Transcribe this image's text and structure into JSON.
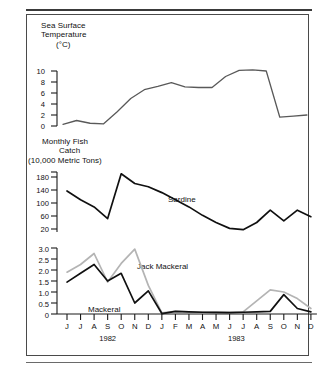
{
  "figure": {
    "name": "sea-surface-temperature-and-monthly-fish-catch",
    "background": "#ffffff",
    "frame_color": "#4a4a4a"
  },
  "colors": {
    "temperature_line": "#595959",
    "sardine_line": "#101010",
    "mackerel_line": "#101010",
    "jack_mackerel_line": "#b4b4b4",
    "axis": "#1a1a1a",
    "text": "#111111"
  },
  "x_axis": {
    "name": "month-axis",
    "months": [
      "J",
      "J",
      "A",
      "S",
      "O",
      "N",
      "D",
      "J",
      "F",
      "M",
      "A",
      "M",
      "J",
      "J",
      "A",
      "S",
      "O",
      "N",
      "D"
    ],
    "year_groups": [
      {
        "label": "1982",
        "start_index": 0,
        "end_index": 6
      },
      {
        "label": "1983",
        "start_index": 7,
        "end_index": 18
      }
    ],
    "tick_count": 19
  },
  "panels": {
    "temperature": {
      "title_line1": "Sea Surface",
      "title_line2": "Temperature",
      "title_line3": "(°C)",
      "y_ticks": [
        "0",
        "2",
        "4",
        "6",
        "8",
        "10"
      ]
    },
    "catch": {
      "title_line1": "Monthly Fish",
      "title_line2": "Catch",
      "title_line3": "(10,000 Metric Tons)",
      "y_ticks": [
        "20",
        "60",
        "100",
        "140",
        "180"
      ],
      "series_label": "Sardine"
    },
    "small_pelagics": {
      "y_ticks": [
        "0",
        "0.5",
        "1.0",
        "1.5",
        "2.0",
        "2.5",
        "3.0"
      ],
      "series_label_jack": "Jack Mackeral",
      "series_label_mackerel": "Mackeral"
    }
  },
  "chart_data": [
    {
      "type": "line",
      "name": "sea-surface-temperature",
      "title": "Sea Surface Temperature (°C)",
      "xlabel": "",
      "ylabel": "Sea Surface Temperature (°C)",
      "x": [
        "J 1982",
        "J 1982",
        "A 1982",
        "S 1982",
        "O 1982",
        "N 1982",
        "D 1982",
        "J 1983",
        "F 1983",
        "M 1983",
        "A 1983",
        "M 1983",
        "J 1983",
        "J 1983",
        "A 1983",
        "S 1983",
        "O 1983",
        "N 1983",
        "D 1983"
      ],
      "ylim": [
        0,
        11
      ],
      "y_ticks": [
        0,
        2,
        4,
        6,
        8,
        10
      ],
      "grid": false,
      "legend": "none",
      "series": [
        {
          "name": "Sea Surface Temperature",
          "color": "#595959",
          "values": [
            0.3,
            1.0,
            0.5,
            0.4,
            2.6,
            5.0,
            6.6,
            7.2,
            7.9,
            7.1,
            7.0,
            7.0,
            9.0,
            10.1,
            10.2,
            10.0,
            1.6,
            1.8,
            2.0,
            0.1
          ]
        }
      ]
    },
    {
      "type": "line",
      "name": "monthly-fish-catch-sardine",
      "title": "Monthly Fish Catch (10,000 Metric Tons)",
      "xlabel": "",
      "ylabel": "Monthly Fish Catch (10,000 Metric Tons)",
      "x": [
        "J 1982",
        "J 1982",
        "A 1982",
        "S 1982",
        "O 1982",
        "N 1982",
        "D 1982",
        "J 1983",
        "F 1983",
        "M 1983",
        "A 1983",
        "M 1983",
        "J 1983",
        "J 1983",
        "A 1983",
        "S 1983",
        "O 1983",
        "N 1983",
        "D 1983"
      ],
      "ylim": [
        0,
        200
      ],
      "y_ticks": [
        20,
        60,
        100,
        140,
        180
      ],
      "grid": false,
      "legend": "inline",
      "series": [
        {
          "name": "Sardine",
          "color": "#101010",
          "values": [
            137,
            110,
            88,
            52,
            190,
            160,
            150,
            132,
            110,
            88,
            62,
            40,
            22,
            18,
            40,
            78,
            45,
            78,
            58,
            132
          ]
        }
      ]
    },
    {
      "type": "line",
      "name": "monthly-catch-mackerel-jack-mackerel",
      "title": "Monthly Fish Catch — Mackeral and Jack Mackeral",
      "xlabel": "",
      "ylabel": "Monthly Fish Catch (10,000 Metric Tons)",
      "x": [
        "J 1982",
        "J 1982",
        "A 1982",
        "S 1982",
        "O 1982",
        "N 1982",
        "D 1982",
        "J 1983",
        "F 1983",
        "M 1983",
        "A 1983",
        "M 1983",
        "J 1983",
        "J 1983",
        "A 1983",
        "S 1983",
        "O 1983",
        "N 1983",
        "D 1983"
      ],
      "ylim": [
        0,
        3.2
      ],
      "y_ticks": [
        0,
        0.5,
        1.0,
        1.5,
        2.0,
        2.5,
        3.0
      ],
      "grid": false,
      "legend": "inline",
      "series": [
        {
          "name": "Jack Mackeral",
          "color": "#b4b4b4",
          "values": [
            1.9,
            2.25,
            2.75,
            1.45,
            2.3,
            2.95,
            1.3,
            0.05,
            0.12,
            0.1,
            0.08,
            0.07,
            0.07,
            0.1,
            0.6,
            1.1,
            1.0,
            0.7,
            0.25,
            0.1
          ]
        },
        {
          "name": "Mackeral",
          "color": "#101010",
          "values": [
            1.45,
            1.85,
            2.25,
            1.5,
            1.85,
            0.5,
            1.05,
            0.02,
            0.12,
            0.1,
            0.08,
            0.07,
            0.06,
            0.08,
            0.1,
            0.12,
            0.88,
            0.25,
            0.1,
            0.08
          ]
        }
      ]
    }
  ]
}
